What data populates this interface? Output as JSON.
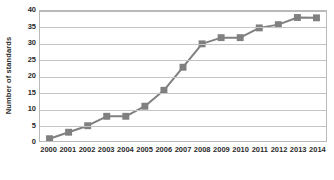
{
  "chart_data": {
    "type": "line",
    "title": "",
    "xlabel": "",
    "ylabel": "Number of standards",
    "categories": [
      "2000",
      "2001",
      "2002",
      "2003",
      "2004",
      "2005",
      "2006",
      "2007",
      "2008",
      "2009",
      "2010",
      "2011",
      "2012",
      "2013",
      "2014"
    ],
    "values": [
      0.7,
      2.7,
      4.7,
      7.6,
      7.6,
      10.7,
      15.6,
      22.7,
      29.9,
      31.8,
      31.8,
      34.8,
      35.8,
      38.0,
      37.9
    ],
    "ylim": [
      0,
      40
    ],
    "yticks": [
      0,
      5,
      10,
      15,
      20,
      25,
      30,
      35,
      40
    ],
    "ytick_labels": [
      "0",
      "5",
      "10",
      "15",
      "20",
      "25",
      "30",
      "35",
      "40"
    ],
    "grid": true,
    "legend": "none",
    "series_color": "#808080",
    "gridline_color": "#c4c4c4",
    "axis_border_color": "#b9b9b9",
    "text_color": "#2b2b2b",
    "background_color": "#ffffff",
    "marker": "square",
    "marker_size": 7,
    "line_width": 2
  }
}
